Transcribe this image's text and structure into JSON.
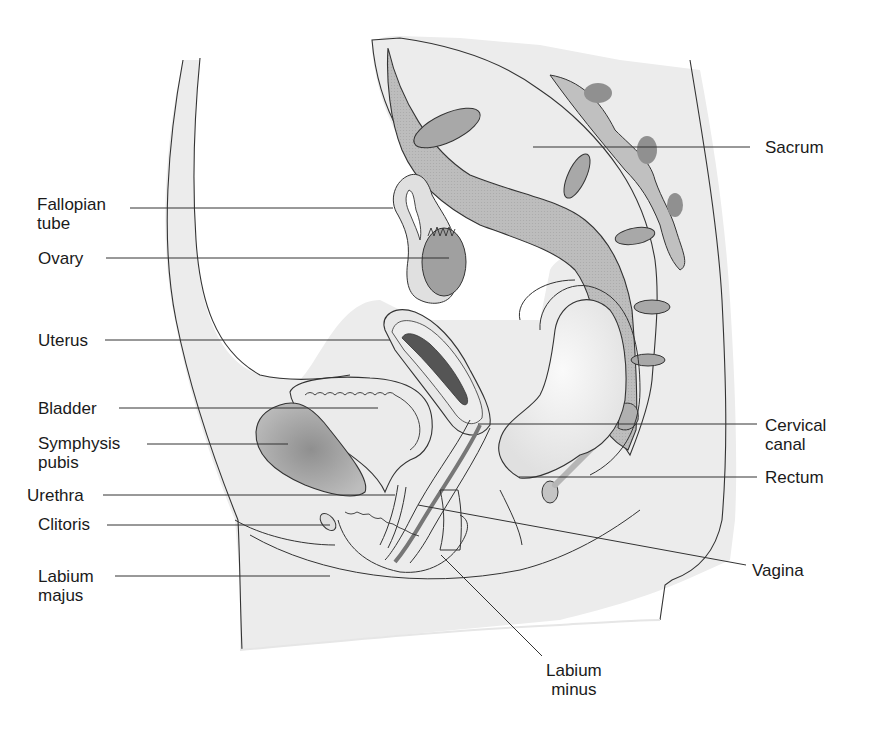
{
  "figure": {
    "colors": {
      "soft_tissue": "#ececec",
      "bone": "#b8b8b8",
      "bone_dark": "#9a9a9a",
      "organ": "#e4e4e4",
      "outline": "#333333",
      "leader": "#333333",
      "text": "#1a1a1a"
    }
  },
  "labels": {
    "left": [
      {
        "id": "fallopian-tube",
        "text": "Fallopian\ntube"
      },
      {
        "id": "ovary",
        "text": "Ovary"
      },
      {
        "id": "uterus",
        "text": "Uterus"
      },
      {
        "id": "bladder",
        "text": "Bladder"
      },
      {
        "id": "symphysis-pubis",
        "text": "Symphysis\npubis"
      },
      {
        "id": "urethra",
        "text": "Urethra"
      },
      {
        "id": "clitoris",
        "text": "Clitoris"
      },
      {
        "id": "labium-majus",
        "text": "Labium\nmajus"
      }
    ],
    "right": [
      {
        "id": "sacrum",
        "text": "Sacrum"
      },
      {
        "id": "cervical-canal",
        "text": "Cervical\ncanal"
      },
      {
        "id": "rectum",
        "text": "Rectum"
      },
      {
        "id": "vagina",
        "text": "Vagina"
      }
    ],
    "bottom": [
      {
        "id": "labium-minus",
        "text": "Labium\nminus"
      }
    ]
  }
}
